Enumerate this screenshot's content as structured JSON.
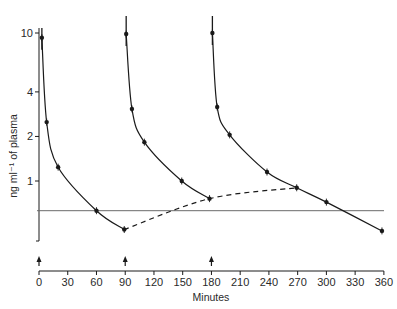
{
  "chart_data": {
    "type": "line",
    "title": "",
    "xlabel": "Minutes",
    "ylabel": "ng ml⁻¹ of plasma",
    "yscale": "log",
    "xlim": [
      0,
      360
    ],
    "ylim": [
      0.35,
      12
    ],
    "grid": false,
    "legend": null,
    "x_ticks": [
      0,
      30,
      60,
      90,
      120,
      150,
      180,
      210,
      240,
      270,
      300,
      330,
      360
    ],
    "y_ticks": [
      1,
      2,
      4,
      10
    ],
    "series": [
      {
        "name": "dose 1 (t=0)",
        "style": "solid",
        "x": [
          3,
          8,
          20,
          60,
          89
        ],
        "y": [
          9.3,
          2.5,
          1.24,
          0.63,
          0.47
        ]
      },
      {
        "name": "dose 2 (t=90)",
        "style": "solid",
        "x": [
          91,
          97,
          110,
          149,
          178
        ],
        "y": [
          9.85,
          3.07,
          1.83,
          1.0,
          0.76
        ]
      },
      {
        "name": "dose 3 (t=180)",
        "style": "solid",
        "x": [
          181,
          186,
          199,
          238,
          269,
          300,
          358
        ],
        "y": [
          10.0,
          3.16,
          2.05,
          1.15,
          0.9,
          0.72,
          0.46
        ]
      },
      {
        "name": "trough trend",
        "style": "dashed",
        "x": [
          89,
          178,
          269
        ],
        "y": [
          0.47,
          0.76,
          0.9
        ]
      }
    ],
    "reference_lines": [
      {
        "orientation": "horizontal",
        "y": 0.63,
        "style": "solid",
        "color": "#6b6b6b"
      }
    ],
    "annotations": [
      {
        "type": "dose-arrow",
        "x": 0
      },
      {
        "type": "dose-arrow",
        "x": 90
      },
      {
        "type": "dose-arrow",
        "x": 180
      }
    ]
  },
  "labels": {
    "xlabel": "Minutes",
    "ylabel": "ng ml⁻¹ of plasma"
  },
  "colors": {
    "ink": "#1a1a1a",
    "reference_line": "#6b6b6b",
    "background": "#ffffff"
  }
}
